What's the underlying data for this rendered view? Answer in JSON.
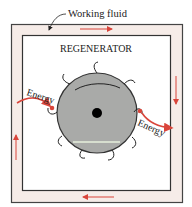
{
  "labels": {
    "working_fluid": "Working fluid",
    "regenerator": "REGENERATOR",
    "energy_in": "Energy",
    "energy_out": "Energy"
  },
  "colors": {
    "frame_fill": "#f6ece8",
    "frame_stroke": "#444444",
    "wheel_fill": "#a9aaa8",
    "wheel_stroke": "#333333",
    "arrow": "#d9453b",
    "hub": "#000000"
  },
  "diagram": {
    "flow_direction": [
      "top: right",
      "right: down",
      "bottom: left",
      "left: up"
    ],
    "components": [
      "working fluid channel",
      "regenerator matrix (rotating wheel)",
      "energy in (left)",
      "energy out (right)"
    ]
  }
}
